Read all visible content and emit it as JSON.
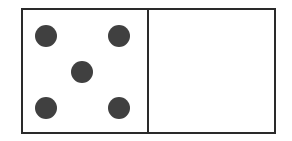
{
  "domino": {
    "left_half": {
      "value": 5,
      "pips": [
        {
          "x": 12,
          "y": 15
        },
        {
          "x": 85,
          "y": 15
        },
        {
          "x": 48,
          "y": 51
        },
        {
          "x": 12,
          "y": 87
        },
        {
          "x": 85,
          "y": 87
        }
      ]
    },
    "right_half": {
      "value": 0,
      "pips": []
    },
    "colors": {
      "border": "#2a2a2a",
      "pip": "#404040",
      "face": "#ffffff"
    }
  }
}
